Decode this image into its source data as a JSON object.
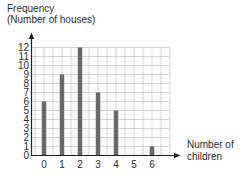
{
  "chart_data": {
    "type": "bar",
    "categories": [
      "0",
      "1",
      "2",
      "3",
      "4",
      "5",
      "6"
    ],
    "values": [
      6,
      9,
      12,
      7,
      5,
      0,
      1
    ],
    "title": "",
    "xlabel": "Number of children",
    "ylabel": "Frequency (Number of houses)",
    "y_axis_title_lines": [
      "Frequency",
      "(Number of houses)"
    ],
    "x_axis_title_lines": [
      "Number of",
      "children"
    ],
    "y_ticks": [
      0,
      1,
      2,
      3,
      4,
      5,
      6,
      7,
      8,
      9,
      10,
      11,
      12
    ],
    "ylim": [
      0,
      12
    ],
    "grid": "on",
    "legend": "none",
    "colors": {
      "bar": "#686868",
      "grid": "#c9c9c9",
      "axis": "#1f1f1f",
      "text": "#2b2b2b",
      "background": "#ffffff"
    }
  }
}
